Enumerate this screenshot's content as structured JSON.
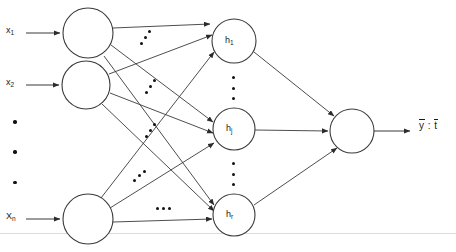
{
  "figure": {
    "kind": "neural-network-diagram",
    "canvas": {
      "width": 456,
      "height": 252,
      "background": "#ffffff"
    },
    "stroke_color": "#3a3a3a",
    "node_fill": "#ffffff",
    "text_color": "#1a1a1a",
    "baseline_rule_color": "#d8d8d8"
  },
  "input_layer": {
    "name": "input-layer",
    "labels": [
      {
        "id": "x1",
        "base": "x",
        "sub": "1",
        "x": 6,
        "y": 28
      },
      {
        "id": "x2",
        "base": "x",
        "sub": "2",
        "x": 6,
        "y": 74
      },
      {
        "id": "xn",
        "base": "X",
        "sub": "n",
        "x": 6,
        "y": 212
      }
    ],
    "vertical_ellipsis": {
      "count": 3,
      "x": 14,
      "y": 118,
      "height": 62
    },
    "nodes": [
      {
        "id": "in-1",
        "cx": 88,
        "cy": 33,
        "r": 25
      },
      {
        "id": "in-2",
        "cx": 86,
        "cy": 85,
        "r": 24
      },
      {
        "id": "in-n",
        "cx": 88,
        "cy": 219,
        "r": 25
      }
    ]
  },
  "hidden_layer": {
    "name": "hidden-layer",
    "nodes": [
      {
        "id": "h1",
        "base": "h",
        "sub": "1",
        "cx": 234,
        "cy": 41,
        "r": 22
      },
      {
        "id": "hj",
        "base": "h",
        "sub": "j",
        "cx": 234,
        "cy": 129,
        "r": 21
      },
      {
        "id": "hr",
        "base": "h",
        "sub": "r",
        "cx": 234,
        "cy": 215,
        "r": 21
      }
    ],
    "vertical_ellipses": [
      {
        "id": "h-ellipsis-upper",
        "count": 3,
        "x": 233,
        "y": 78,
        "height": 22
      },
      {
        "id": "h-ellipsis-lower",
        "count": 3,
        "x": 233,
        "y": 164,
        "height": 22
      }
    ]
  },
  "output_layer": {
    "name": "output-layer",
    "node": {
      "id": "out-1",
      "cx": 352,
      "cy": 131,
      "r": 22
    },
    "label": {
      "y_symbol": "y",
      "separator": " : ",
      "t_symbol": "t",
      "x": 420,
      "y": 120
    }
  },
  "connection_ellipses": [
    {
      "id": "weights-dots-a",
      "orientation": "diagonal",
      "x": 140,
      "y": 33,
      "count": 3
    },
    {
      "id": "weights-dots-b",
      "orientation": "diagonal",
      "x": 146,
      "y": 82,
      "count": 3
    },
    {
      "id": "weights-dots-c",
      "orientation": "diagonal",
      "x": 146,
      "y": 126,
      "count": 3
    },
    {
      "id": "weights-dots-d",
      "orientation": "diagonal",
      "x": 133,
      "y": 172,
      "count": 3
    },
    {
      "id": "weights-dots-e",
      "orientation": "horizontal",
      "x": 157,
      "y": 209,
      "count": 3
    }
  ],
  "edges": {
    "input_arrows": [
      {
        "from": [
          26,
          33
        ],
        "to": [
          62,
          33
        ]
      },
      {
        "from": [
          26,
          85
        ],
        "to": [
          61,
          85
        ]
      },
      {
        "from": [
          26,
          219
        ],
        "to": [
          62,
          219
        ]
      }
    ],
    "output_arrow": {
      "from": [
        375,
        131
      ],
      "to": [
        412,
        131
      ]
    },
    "input_to_hidden": [
      {
        "from": "in-1",
        "to": "h1"
      },
      {
        "from": "in-1",
        "to": "hj"
      },
      {
        "from": "in-1",
        "to": "hr"
      },
      {
        "from": "in-2",
        "to": "h1"
      },
      {
        "from": "in-2",
        "to": "hj"
      },
      {
        "from": "in-2",
        "to": "hr"
      },
      {
        "from": "in-n",
        "to": "h1"
      },
      {
        "from": "in-n",
        "to": "hj"
      },
      {
        "from": "in-n",
        "to": "hr"
      }
    ],
    "hidden_to_output": [
      {
        "from": "h1",
        "to": "out-1"
      },
      {
        "from": "hj",
        "to": "out-1"
      },
      {
        "from": "hr",
        "to": "out-1"
      }
    ]
  }
}
